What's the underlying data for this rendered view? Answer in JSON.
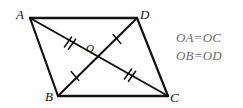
{
  "figure": {
    "type": "geometry-diagram",
    "shape": "parallelogram",
    "background_color": "#ffffff",
    "stroke_color": "#111111",
    "annotation_color": "#6e6e6e",
    "width": 243,
    "height": 108
  },
  "vertices": [
    {
      "id": "A",
      "label": "A",
      "x": 30,
      "y": 18,
      "label_x": 16,
      "label_y": 8
    },
    {
      "id": "D",
      "label": "D",
      "x": 137,
      "y": 18,
      "label_x": 140,
      "label_y": 8
    },
    {
      "id": "B",
      "label": "B",
      "x": 58,
      "y": 96,
      "label_x": 45,
      "label_y": 90
    },
    {
      "id": "C",
      "label": "C",
      "x": 168,
      "y": 96,
      "label_x": 170,
      "label_y": 91
    }
  ],
  "intersection": {
    "id": "O",
    "label": "O",
    "x": 96,
    "y": 58,
    "label_x": 86,
    "label_y": 43
  },
  "edges": [
    {
      "id": "AD",
      "from": "A",
      "to": "D",
      "kind": "side"
    },
    {
      "id": "DC",
      "from": "D",
      "to": "C",
      "kind": "side"
    },
    {
      "id": "CB",
      "from": "C",
      "to": "B",
      "kind": "side"
    },
    {
      "id": "BA",
      "from": "B",
      "to": "A",
      "kind": "side"
    },
    {
      "id": "AC",
      "from": "A",
      "to": "C",
      "kind": "diagonal"
    },
    {
      "id": "BD",
      "from": "B",
      "to": "D",
      "kind": "diagonal"
    }
  ],
  "tick_marks": [
    {
      "id": "tick-AO",
      "segment": "AO",
      "count": 2,
      "x": 68,
      "y": 42
    },
    {
      "id": "tick-OC",
      "segment": "OC",
      "count": 2,
      "x": 128,
      "y": 74
    },
    {
      "id": "tick-OD",
      "segment": "OD",
      "count": 1,
      "x": 117,
      "y": 39
    },
    {
      "id": "tick-BO",
      "segment": "BO",
      "count": 1,
      "x": 75,
      "y": 76
    }
  ],
  "annotations": [
    {
      "id": "annotation-oa-oc",
      "text": "OA=OC"
    },
    {
      "id": "annotation-ob-od",
      "text": "OB=OD"
    }
  ]
}
